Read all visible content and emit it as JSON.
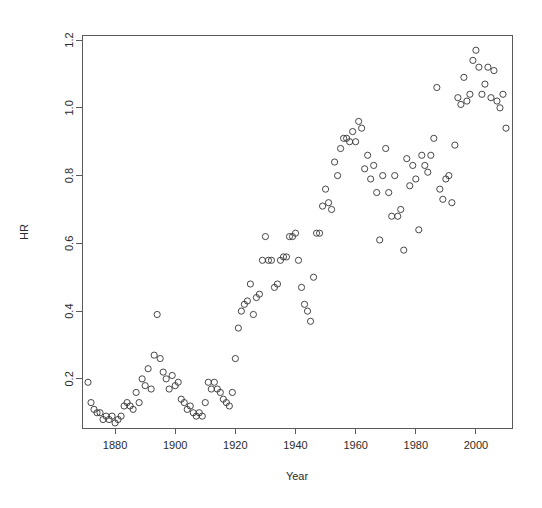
{
  "chart_data": {
    "type": "scatter",
    "title": "",
    "xlabel": "Year",
    "ylabel": "HR",
    "xlim": [
      1869,
      2012
    ],
    "ylim": [
      0.055,
      1.215
    ],
    "grid": false,
    "legend": null,
    "marker": "open-circle",
    "marker_color": "#333333",
    "xticks": [
      1880,
      1900,
      1920,
      1940,
      1960,
      1980,
      2000
    ],
    "xtick_labels": [
      "1880",
      "1900",
      "1920",
      "1940",
      "1960",
      "1980",
      "2000"
    ],
    "yticks": [
      0.2,
      0.4,
      0.6,
      0.8,
      1.0,
      1.2
    ],
    "ytick_labels": [
      "0.2",
      "0.4",
      "0.6",
      "0.8",
      "1.0",
      "1.2"
    ],
    "series": [
      {
        "name": "HR",
        "x": [
          1871,
          1872,
          1873,
          1874,
          1875,
          1876,
          1877,
          1878,
          1879,
          1880,
          1881,
          1882,
          1883,
          1884,
          1885,
          1886,
          1887,
          1888,
          1889,
          1890,
          1891,
          1892,
          1893,
          1894,
          1895,
          1896,
          1897,
          1898,
          1899,
          1900,
          1901,
          1902,
          1903,
          1904,
          1905,
          1906,
          1907,
          1908,
          1909,
          1910,
          1911,
          1912,
          1913,
          1914,
          1915,
          1916,
          1917,
          1918,
          1919,
          1920,
          1921,
          1922,
          1923,
          1924,
          1925,
          1926,
          1927,
          1928,
          1929,
          1930,
          1931,
          1932,
          1933,
          1934,
          1935,
          1936,
          1937,
          1938,
          1939,
          1940,
          1941,
          1942,
          1943,
          1944,
          1945,
          1946,
          1947,
          1948,
          1949,
          1950,
          1951,
          1952,
          1953,
          1954,
          1955,
          1956,
          1957,
          1958,
          1959,
          1960,
          1961,
          1962,
          1963,
          1964,
          1965,
          1966,
          1967,
          1968,
          1969,
          1970,
          1971,
          1972,
          1973,
          1974,
          1975,
          1976,
          1977,
          1978,
          1979,
          1980,
          1981,
          1982,
          1983,
          1984,
          1985,
          1986,
          1987,
          1988,
          1989,
          1990,
          1991,
          1992,
          1993,
          1994,
          1995,
          1996,
          1997,
          1998,
          1999,
          2000,
          2001,
          2002,
          2003,
          2004,
          2005,
          2006,
          2007,
          2008,
          2009,
          2010
        ],
        "y": [
          0.19,
          0.13,
          0.11,
          0.1,
          0.1,
          0.08,
          0.09,
          0.08,
          0.09,
          0.07,
          0.08,
          0.09,
          0.12,
          0.13,
          0.12,
          0.11,
          0.16,
          0.13,
          0.2,
          0.18,
          0.23,
          0.17,
          0.27,
          0.39,
          0.26,
          0.22,
          0.2,
          0.17,
          0.21,
          0.18,
          0.19,
          0.14,
          0.13,
          0.11,
          0.12,
          0.1,
          0.09,
          0.1,
          0.09,
          0.13,
          0.19,
          0.17,
          0.19,
          0.17,
          0.16,
          0.14,
          0.13,
          0.12,
          0.16,
          0.26,
          0.35,
          0.4,
          0.42,
          0.43,
          0.48,
          0.39,
          0.44,
          0.45,
          0.55,
          0.62,
          0.55,
          0.55,
          0.47,
          0.48,
          0.55,
          0.56,
          0.56,
          0.62,
          0.62,
          0.63,
          0.55,
          0.47,
          0.42,
          0.4,
          0.37,
          0.5,
          0.63,
          0.63,
          0.71,
          0.76,
          0.72,
          0.7,
          0.84,
          0.8,
          0.88,
          0.91,
          0.91,
          0.9,
          0.93,
          0.9,
          0.96,
          0.94,
          0.82,
          0.86,
          0.79,
          0.83,
          0.75,
          0.61,
          0.8,
          0.88,
          0.75,
          0.68,
          0.8,
          0.68,
          0.7,
          0.58,
          0.85,
          0.77,
          0.83,
          0.79,
          0.64,
          0.86,
          0.83,
          0.81,
          0.86,
          0.91,
          1.06,
          0.76,
          0.73,
          0.79,
          0.8,
          0.72,
          0.89,
          1.03,
          1.01,
          1.09,
          1.02,
          1.04,
          1.14,
          1.17,
          1.12,
          1.04,
          1.07,
          1.12,
          1.03,
          1.11,
          1.02,
          1.0,
          1.04,
          0.94
        ]
      }
    ]
  },
  "axes": {
    "x_title": "Year",
    "y_title": "HR"
  }
}
